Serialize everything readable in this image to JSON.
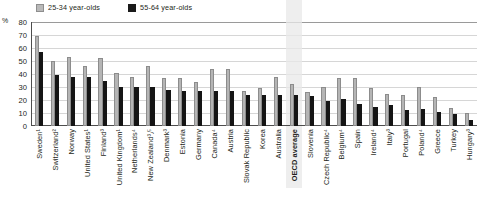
{
  "legend": {
    "items": [
      {
        "label": "25-34 year-olds",
        "color": "#b5b5b5",
        "key": "young"
      },
      {
        "label": "55-64 year-olds",
        "color": "#151515",
        "key": "old"
      }
    ]
  },
  "axis": {
    "unit_label": "%",
    "ticks": [
      "80",
      "70",
      "60",
      "50",
      "40",
      "30",
      "20",
      "10",
      "0"
    ]
  },
  "chart_data": {
    "type": "bar",
    "title": "",
    "xlabel": "",
    "ylabel": "%",
    "ylim": [
      0,
      80
    ],
    "grid": true,
    "legend_position": "top-left",
    "highlight_category": "OECD average",
    "categories": [
      "Sweden¹",
      "Switzerland²",
      "Norway",
      "United States¹",
      "Finland³",
      "United Kingdom¹",
      "Netherlands⁴",
      "New Zealand³٫⁵",
      "Denmark³",
      "Estonia",
      "Germany",
      "Canada⁴",
      "Austria",
      "Slovak Republic",
      "Korea",
      "Australia",
      "OECD average",
      "Slovenia",
      "Czech Republic⁴",
      "Belgium⁴",
      "Spain",
      "Ireland⁴",
      "Italy³",
      "Portugal",
      "Poland⁴",
      "Greece",
      "Turkey",
      "Hungary³"
    ],
    "series": [
      {
        "name": "25-34 year-olds",
        "color": "#b5b5b5",
        "values": [
          69,
          50,
          53,
          46,
          52,
          41,
          38,
          46,
          37,
          37,
          34,
          44,
          44,
          27,
          29,
          38,
          32,
          26,
          30,
          37,
          37,
          29,
          25,
          24,
          30,
          22,
          14,
          10
        ]
      },
      {
        "name": "55-64 year-olds",
        "color": "#151515",
        "values": [
          57,
          39,
          38,
          38,
          35,
          30,
          30,
          30,
          28,
          27,
          27,
          27,
          27,
          24,
          24,
          24,
          24,
          23,
          19,
          21,
          17,
          15,
          16,
          12,
          13,
          11,
          9,
          5
        ]
      }
    ]
  }
}
